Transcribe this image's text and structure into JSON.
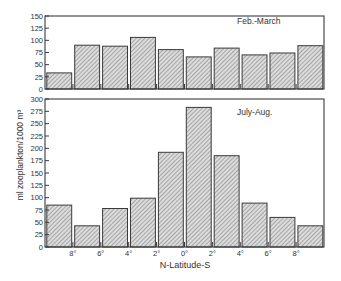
{
  "chart_data": [
    {
      "type": "bar",
      "panel": "top",
      "title": "Feb.-March",
      "categories": [
        "8-10°N",
        "6-8°N",
        "4-6°N",
        "2-4°N",
        "0-2°N",
        "0-2°S",
        "2-4°S",
        "4-6°S",
        "6-8°S",
        "8-10°S"
      ],
      "values": [
        33,
        90,
        88,
        106,
        81,
        66,
        84,
        70,
        74,
        89
      ],
      "ylabel": "ml zooplankton/1000 m³",
      "xlabel": "N-Latitude-S",
      "ylim": [
        0,
        150
      ],
      "yticks": [
        0,
        25,
        50,
        75,
        100,
        125,
        150
      ],
      "grid": false,
      "legend_position": "upper right (panel label)"
    },
    {
      "type": "bar",
      "panel": "bottom",
      "title": "July-Aug.",
      "categories": [
        "8-10°N",
        "6-8°N",
        "4-6°N",
        "2-4°N",
        "0-2°N",
        "0-2°S",
        "2-4°S",
        "4-6°S",
        "6-8°S",
        "8-10°S"
      ],
      "values": [
        85,
        43,
        78,
        99,
        192,
        283,
        185,
        89,
        60,
        43
      ],
      "ylabel": "ml zooplankton/1000 m³",
      "xlabel": "N-Latitude-S",
      "ylim": [
        0,
        300
      ],
      "yticks": [
        0,
        25,
        50,
        75,
        100,
        125,
        150,
        175,
        200,
        225,
        250,
        275,
        300
      ],
      "xtick_labels": [
        "8°",
        "6°",
        "4°",
        "2°",
        "0°",
        "2°",
        "4°",
        "6°",
        "8°"
      ],
      "grid": false,
      "legend_position": "upper right (panel label)"
    }
  ],
  "labels": {
    "top_panel": "Feb.-March",
    "bottom_panel": "July-Aug.",
    "y_axis": "ml zooplankton/1000 m³",
    "x_axis": "N-Latitude-S"
  },
  "colors": {
    "frame": "#3a3a3a",
    "bar_fill": "#d8d8d8",
    "hatch": "#7a7a7a"
  }
}
